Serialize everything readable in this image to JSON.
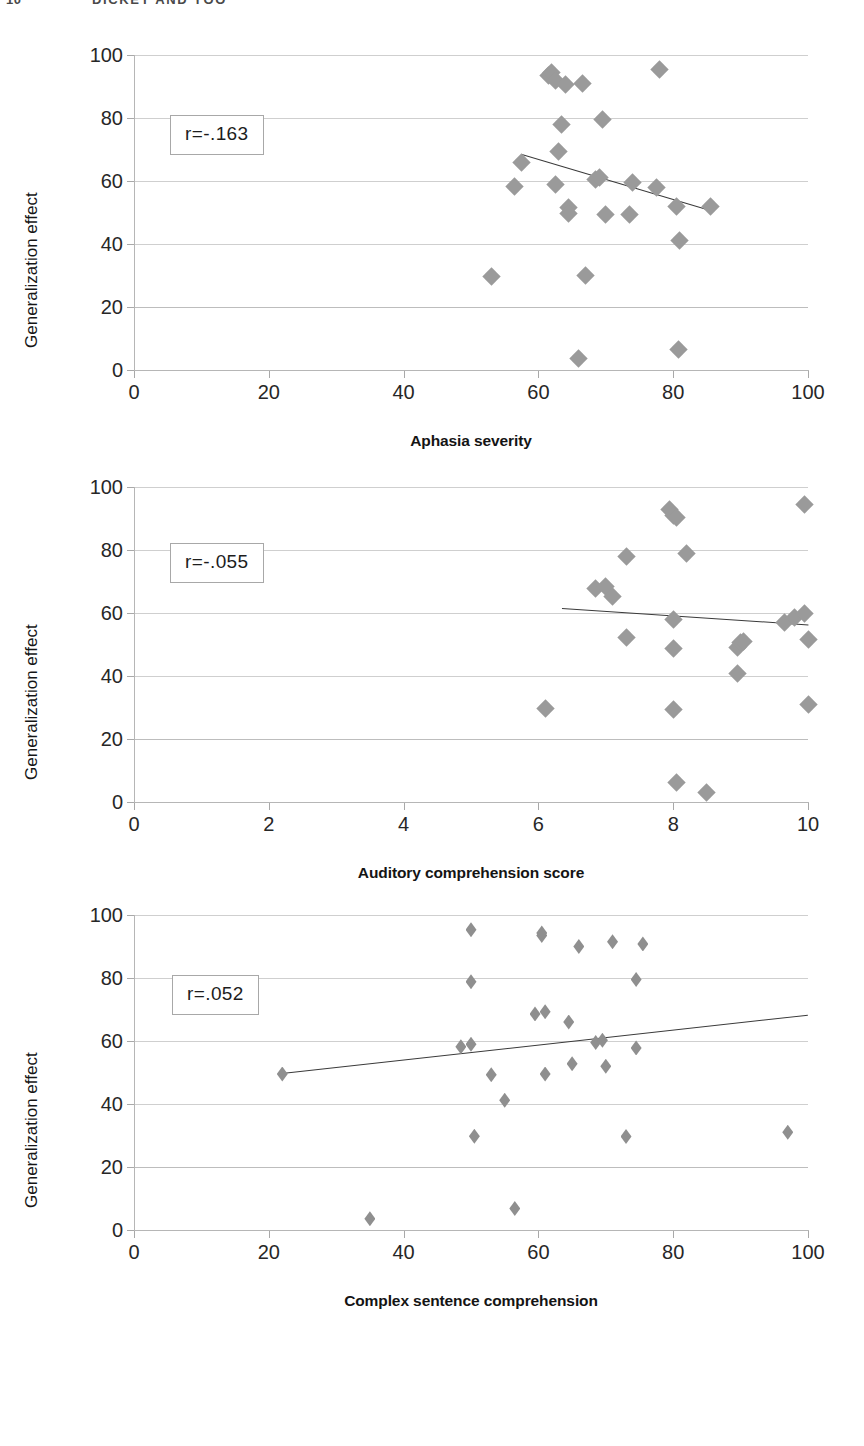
{
  "runhead": {
    "folio": "10",
    "title": "DICKEY AND YOO"
  },
  "axis_title_y": "Generalization effect",
  "figures": [
    {
      "name": "aphasia-severity",
      "annotation": "r=-.163",
      "chart": {
        "type": "scatter",
        "title": "",
        "xlabel": "Aphasia severity",
        "ylabel": "Generalization effect",
        "xlim": [
          0,
          100
        ],
        "ylim": [
          0,
          100
        ],
        "xticks": [
          0,
          20,
          40,
          60,
          80,
          100
        ],
        "yticks": [
          0,
          20,
          40,
          60,
          80,
          100
        ],
        "grid": true,
        "legend": "none",
        "annotations": [
          "r=-.163"
        ],
        "correlation": -0.163,
        "points": [
          {
            "x": 53.0,
            "y": 29.8
          },
          {
            "x": 56.5,
            "y": 58.3
          },
          {
            "x": 57.5,
            "y": 66.0
          },
          {
            "x": 61.5,
            "y": 93.5
          },
          {
            "x": 62.0,
            "y": 94.5
          },
          {
            "x": 62.5,
            "y": 92.0
          },
          {
            "x": 62.5,
            "y": 59.0
          },
          {
            "x": 63.0,
            "y": 69.3
          },
          {
            "x": 63.5,
            "y": 78.0
          },
          {
            "x": 64.0,
            "y": 90.5
          },
          {
            "x": 64.5,
            "y": 51.5
          },
          {
            "x": 64.5,
            "y": 49.8
          },
          {
            "x": 66.0,
            "y": 3.5
          },
          {
            "x": 66.5,
            "y": 91.0
          },
          {
            "x": 67.0,
            "y": 30.0
          },
          {
            "x": 68.5,
            "y": 60.5
          },
          {
            "x": 69.0,
            "y": 61.0
          },
          {
            "x": 69.5,
            "y": 79.5
          },
          {
            "x": 70.0,
            "y": 49.5
          },
          {
            "x": 73.5,
            "y": 49.5
          },
          {
            "x": 74.0,
            "y": 59.5
          },
          {
            "x": 77.5,
            "y": 57.8
          },
          {
            "x": 78.0,
            "y": 95.5
          },
          {
            "x": 80.5,
            "y": 52.0
          },
          {
            "x": 81.0,
            "y": 41.0
          },
          {
            "x": 80.8,
            "y": 6.5
          },
          {
            "x": 85.5,
            "y": 51.8
          }
        ],
        "trendline": {
          "x0": 57.5,
          "y0": 68.5,
          "x1": 85.0,
          "y1": 51.0
        }
      }
    },
    {
      "name": "auditory-comprehension",
      "annotation": "r=-.055",
      "chart": {
        "type": "scatter",
        "title": "",
        "xlabel": "Auditory comprehension score",
        "ylabel": "Generalization effect",
        "xlim": [
          0,
          10
        ],
        "ylim": [
          0,
          100
        ],
        "xticks": [
          0,
          2,
          4,
          6,
          8,
          10
        ],
        "yticks": [
          0,
          20,
          40,
          60,
          80,
          100
        ],
        "grid": true,
        "legend": "none",
        "annotations": [
          "r=-.055"
        ],
        "correlation": -0.055,
        "points": [
          {
            "x": 6.1,
            "y": 29.7
          },
          {
            "x": 6.85,
            "y": 67.8
          },
          {
            "x": 7.0,
            "y": 68.5
          },
          {
            "x": 7.1,
            "y": 65.3
          },
          {
            "x": 7.3,
            "y": 78.0
          },
          {
            "x": 7.3,
            "y": 52.2
          },
          {
            "x": 7.95,
            "y": 92.8
          },
          {
            "x": 8.0,
            "y": 91.0
          },
          {
            "x": 8.05,
            "y": 90.2
          },
          {
            "x": 8.0,
            "y": 57.8
          },
          {
            "x": 8.0,
            "y": 48.7
          },
          {
            "x": 8.0,
            "y": 29.3
          },
          {
            "x": 8.05,
            "y": 6.2
          },
          {
            "x": 8.2,
            "y": 78.8
          },
          {
            "x": 8.5,
            "y": 3.0
          },
          {
            "x": 8.95,
            "y": 49.0
          },
          {
            "x": 9.0,
            "y": 50.6
          },
          {
            "x": 9.05,
            "y": 51.0
          },
          {
            "x": 8.95,
            "y": 40.7
          },
          {
            "x": 9.65,
            "y": 57.0
          },
          {
            "x": 9.8,
            "y": 58.5
          },
          {
            "x": 9.95,
            "y": 59.8
          },
          {
            "x": 9.95,
            "y": 94.5
          },
          {
            "x": 10.0,
            "y": 51.5
          },
          {
            "x": 10.0,
            "y": 30.8
          }
        ],
        "trendline": {
          "x0": 6.35,
          "y0": 61.5,
          "x1": 10.0,
          "y1": 56.3
        }
      }
    },
    {
      "name": "complex-sentence-comprehension",
      "annotation": "r=.052",
      "chart": {
        "type": "scatter",
        "title": "",
        "xlabel": "Complex sentence comprehension",
        "ylabel": "Generalization effect",
        "xlim": [
          0,
          100
        ],
        "ylim": [
          0,
          100
        ],
        "xticks": [
          0,
          20,
          40,
          60,
          80,
          100
        ],
        "yticks": [
          0,
          20,
          40,
          60,
          80,
          100
        ],
        "grid": true,
        "legend": "none",
        "annotations": [
          "r=.052"
        ],
        "correlation": 0.052,
        "points": [
          {
            "x": 22.0,
            "y": 49.5
          },
          {
            "x": 35.0,
            "y": 3.6
          },
          {
            "x": 48.5,
            "y": 58.2
          },
          {
            "x": 50.0,
            "y": 95.3
          },
          {
            "x": 50.0,
            "y": 78.8
          },
          {
            "x": 50.0,
            "y": 59.0
          },
          {
            "x": 50.5,
            "y": 29.8
          },
          {
            "x": 53.0,
            "y": 49.3
          },
          {
            "x": 55.0,
            "y": 41.2
          },
          {
            "x": 56.5,
            "y": 6.8
          },
          {
            "x": 59.5,
            "y": 68.6
          },
          {
            "x": 60.5,
            "y": 93.5
          },
          {
            "x": 60.5,
            "y": 94.3
          },
          {
            "x": 61.0,
            "y": 69.3
          },
          {
            "x": 61.0,
            "y": 49.5
          },
          {
            "x": 64.5,
            "y": 66.0
          },
          {
            "x": 65.0,
            "y": 52.8
          },
          {
            "x": 66.0,
            "y": 90.0
          },
          {
            "x": 68.5,
            "y": 59.5
          },
          {
            "x": 69.5,
            "y": 60.2
          },
          {
            "x": 70.0,
            "y": 52.0
          },
          {
            "x": 71.0,
            "y": 91.5
          },
          {
            "x": 73.0,
            "y": 29.7
          },
          {
            "x": 74.5,
            "y": 57.8
          },
          {
            "x": 74.5,
            "y": 79.5
          },
          {
            "x": 75.5,
            "y": 90.8
          },
          {
            "x": 97.0,
            "y": 31.0
          }
        ],
        "trendline": {
          "x0": 22.0,
          "y0": 50.0,
          "x1": 100.0,
          "y1": 68.5
        }
      }
    }
  ]
}
